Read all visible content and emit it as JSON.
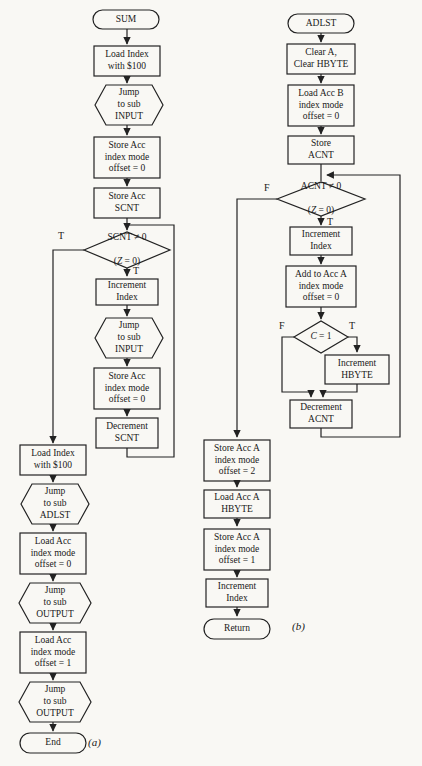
{
  "figure": {
    "background": "#f9f8f4",
    "ink": "#222222"
  },
  "flow_a": {
    "caption": "(a)",
    "start": "SUM",
    "load_index_100_1": "Load Index\nwith $100",
    "jump_sub_input_1": "Jump\nto sub\nINPUT",
    "store_acc_offset_0_1": "Store Acc\nindex mode\noffset = 0",
    "store_acc_scnt": "Store Acc\nSCNT",
    "decision_scnt_line1": "SCNT ≠ 0",
    "decision_scnt_open": "(",
    "decision_scnt_var": "Z",
    "decision_scnt_rest": " = 0)",
    "branch_scnt_exit": "T",
    "branch_scnt_true": "T",
    "increment_index": "Increment\nIndex",
    "jump_sub_input_2": "Jump\nto sub\nINPUT",
    "store_acc_offset_0_2": "Store Acc\nindex mode\noffset = 0",
    "decrement_scnt": "Decrement\nSCNT",
    "load_index_100_2": "Load Index\nwith $100",
    "jump_sub_adlst": "Jump\nto sub\nADLST",
    "load_acc_offset_0": "Load Acc\nindex mode\noffset = 0",
    "jump_sub_output_1": "Jump\nto sub\nOUTPUT",
    "load_acc_offset_1": "Load Acc\nindex mode\noffset = 1",
    "jump_sub_output_2": "Jump\nto sub\nOUTPUT",
    "end": "End"
  },
  "flow_b": {
    "caption": "(b)",
    "start": "ADLST",
    "clear_a_hbyte": "Clear A,\nClear HBYTE",
    "load_acc_b_offset_0": "Load Acc B\nindex mode\noffset = 0",
    "store_acnt": "Store\nACNT",
    "decision_acnt_line1": "ACNT ≠ 0",
    "decision_acnt_open": "(",
    "decision_acnt_var": "Z",
    "decision_acnt_rest": " = 0)",
    "branch_acnt_false": "F",
    "branch_acnt_true": "T",
    "increment_index_1": "Increment\nIndex",
    "add_acc_a_offset_0": "Add to Acc A\nindex mode\noffset = 0",
    "decision_c_var": "C",
    "decision_c_rest": " = 1",
    "branch_c_false": "F",
    "branch_c_true": "T",
    "increment_hbyte": "Increment\nHBYTE",
    "decrement_acnt": "Decrement\nACNT",
    "store_acc_a_offset_2": "Store Acc A\nindex mode\noffset = 2",
    "load_acc_a_hbyte": "Load Acc A\nHBYTE",
    "store_acc_a_offset_1": "Store Acc A\nindex mode\noffset = 1",
    "increment_index_2": "Increment\nIndex",
    "return": "Return"
  }
}
